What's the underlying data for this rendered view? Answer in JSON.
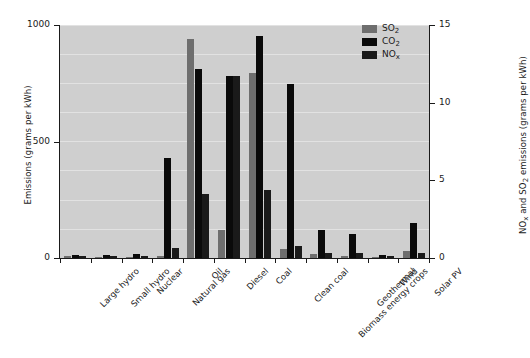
{
  "chart_data": {
    "type": "bar",
    "title": "",
    "subtitle": "",
    "xlabel": "",
    "ylabel": "Emissions (grams per kWh)",
    "ylabel_right": "NOx and SO2 emissions (grams per kWh)",
    "grid": true,
    "legend_position": "top-right",
    "ylim": [
      0,
      1000
    ],
    "ylim_right": [
      0,
      15
    ],
    "yticks": [
      0,
      500,
      1000
    ],
    "yticks_right": [
      0,
      5,
      10,
      15
    ],
    "categories": [
      "Large hydro",
      "Small hydro",
      "Nuclear",
      "Natural gas",
      "Oil",
      "Diesel",
      "Coal",
      "Clean coal",
      "Biomass energy crops",
      "Geothermal",
      "Wind",
      "Solar PV"
    ],
    "series": [
      {
        "name": "SO2",
        "axis": "right",
        "color": "#6e6e6e",
        "values": [
          0.1,
          0.05,
          0.08,
          0.12,
          14.1,
          1.8,
          11.9,
          0.55,
          0.27,
          0.1,
          0.08,
          0.45
        ]
      },
      {
        "name": "CO2",
        "axis": "left",
        "color": "#0a0a0a",
        "values": [
          15,
          12,
          18,
          430,
          810,
          780,
          955,
          745,
          122,
          105,
          14,
          150
        ]
      },
      {
        "name": "NOx",
        "axis": "right",
        "color": "#1a1a1a",
        "values": [
          0.12,
          0.1,
          0.14,
          0.62,
          4.15,
          11.7,
          4.35,
          0.78,
          0.3,
          0.32,
          0.12,
          0.3
        ]
      }
    ]
  },
  "axes": {
    "left": {
      "title": "Emissions (grams per kWh)",
      "ticks": [
        "0",
        "500",
        "1000"
      ]
    },
    "right": {
      "title_plain": "NOx and SO2 emissions (grams per kWh)",
      "ticks": [
        "0",
        "5",
        "10",
        "15"
      ]
    }
  },
  "legend": {
    "items": [
      {
        "label_plain": "SO2",
        "base": "SO",
        "sub": "2",
        "color": "#6e6e6e"
      },
      {
        "label_plain": "CO2",
        "base": "CO",
        "sub": "2",
        "color": "#0a0a0a"
      },
      {
        "label_plain": "NOx",
        "base": "NO",
        "sub": "x",
        "color": "#1a1a1a"
      }
    ]
  },
  "colors": {
    "plot_background": "#cfcfcf",
    "grid": "#e2e2e2",
    "axis": "#1a1a1a",
    "page_background": "#ffffff"
  }
}
